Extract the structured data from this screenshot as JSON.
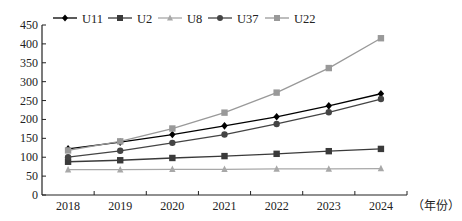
{
  "chart_data": {
    "type": "line",
    "title": "",
    "xlabel": "（年份）",
    "ylabel": "",
    "categories": [
      "2018",
      "2019",
      "2020",
      "2021",
      "2022",
      "2023",
      "2024"
    ],
    "ylim": [
      0,
      450
    ],
    "yticks": [
      0,
      50,
      100,
      150,
      200,
      250,
      300,
      350,
      400,
      450
    ],
    "grid": false,
    "legend_position": "top",
    "series": [
      {
        "name": "U11",
        "color": "#000000",
        "marker": "diamond",
        "values": [
          122,
          140,
          160,
          183,
          207,
          236,
          268
        ]
      },
      {
        "name": "U2",
        "color": "#3a3a3a",
        "marker": "square",
        "values": [
          88,
          92,
          98,
          103,
          109,
          116,
          122
        ]
      },
      {
        "name": "U8",
        "color": "#a8a8a8",
        "marker": "triangle",
        "values": [
          67,
          67,
          68,
          68,
          69,
          69,
          70
        ]
      },
      {
        "name": "U37",
        "color": "#444444",
        "marker": "circle",
        "values": [
          100,
          117,
          138,
          160,
          188,
          219,
          254
        ]
      },
      {
        "name": "U22",
        "color": "#999999",
        "marker": "square",
        "values": [
          118,
          142,
          176,
          218,
          271,
          336,
          415
        ]
      }
    ]
  }
}
